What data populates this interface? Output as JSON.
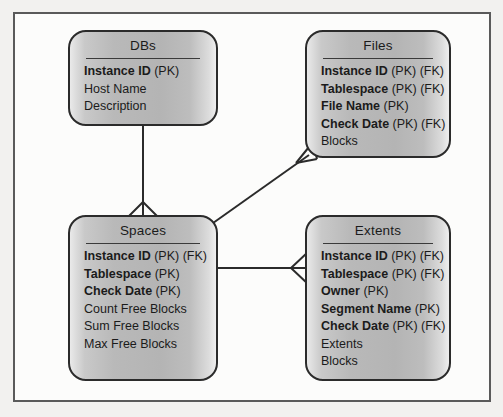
{
  "diagram": {
    "type": "entity-relationship-diagram",
    "notation": "crow's foot",
    "entities": [
      {
        "id": "dbs",
        "title": "DBs",
        "attributes": [
          {
            "name": "Instance ID",
            "keys": "(PK)",
            "bold": true
          },
          {
            "name": "Host Name",
            "keys": "",
            "bold": false
          },
          {
            "name": "Description",
            "keys": "",
            "bold": false
          }
        ]
      },
      {
        "id": "files",
        "title": "Files",
        "attributes": [
          {
            "name": "Instance ID",
            "keys": "(PK) (FK)",
            "bold": true
          },
          {
            "name": "Tablespace",
            "keys": "(PK) (FK)",
            "bold": true
          },
          {
            "name": "File Name",
            "keys": "(PK)",
            "bold": true
          },
          {
            "name": "Check Date",
            "keys": "(PK) (FK)",
            "bold": true
          },
          {
            "name": "Blocks",
            "keys": "",
            "bold": false
          }
        ]
      },
      {
        "id": "spaces",
        "title": "Spaces",
        "attributes": [
          {
            "name": "Instance ID",
            "keys": "(PK) (FK)",
            "bold": true
          },
          {
            "name": "Tablespace",
            "keys": "(PK)",
            "bold": true
          },
          {
            "name": "Check Date",
            "keys": "(PK)",
            "bold": true
          },
          {
            "name": "Count Free Blocks",
            "keys": "",
            "bold": false
          },
          {
            "name": "Sum Free Blocks",
            "keys": "",
            "bold": false
          },
          {
            "name": "Max Free Blocks",
            "keys": "",
            "bold": false
          }
        ]
      },
      {
        "id": "extents",
        "title": "Extents",
        "attributes": [
          {
            "name": "Instance ID",
            "keys": "(PK) (FK)",
            "bold": true
          },
          {
            "name": "Tablespace",
            "keys": "(PK) (FK)",
            "bold": true
          },
          {
            "name": "Owner",
            "keys": "(PK)",
            "bold": true
          },
          {
            "name": "Segment Name",
            "keys": "(PK)",
            "bold": true
          },
          {
            "name": "Check Date",
            "keys": "(PK) (FK)",
            "bold": true
          },
          {
            "name": "Extents",
            "keys": "",
            "bold": false
          },
          {
            "name": "Blocks",
            "keys": "",
            "bold": false
          }
        ]
      }
    ],
    "relationships": [
      {
        "id": "dbs-spaces",
        "from": "DBs",
        "to": "Spaces",
        "many_end": "Spaces"
      },
      {
        "id": "spaces-files",
        "from": "Spaces",
        "to": "Files",
        "many_end": "Files"
      },
      {
        "id": "spaces-extents",
        "from": "Spaces",
        "to": "Extents",
        "many_end": "Extents"
      }
    ],
    "colors": {
      "frame_border": "#5a5a5a",
      "page_background": "#fcfcfb",
      "outer_background": "#f2f1ef",
      "entity_border": "#2b2b2b",
      "entity_fill_light": "#e9e9e9",
      "entity_fill_dark": "#b4b4b4",
      "text": "#1b1b1b",
      "connector": "#2b2b2b"
    }
  }
}
